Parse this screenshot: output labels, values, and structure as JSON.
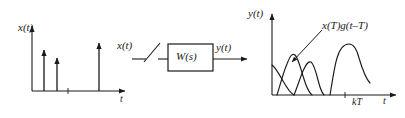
{
  "figure": {
    "background_color": "#ffffff",
    "line_color": "#1a1a1a"
  },
  "left_plot": {
    "y_axis_label": "x(t)",
    "x_axis_label": "t",
    "origin_tick_label": "0",
    "impulses": [
      {
        "position_label": "1",
        "height_fraction": 0.62
      },
      {
        "position_label": "2",
        "height_fraction": 0.48
      },
      {
        "position_label": "3",
        "height_fraction": 0.75
      }
    ]
  },
  "block_diagram": {
    "input_label": "x(t)",
    "sampler_name": "sampler-switch",
    "block_label": "W(s)",
    "output_label": "y(t)"
  },
  "right_plot": {
    "y_axis_label": "y(t)",
    "x_axis_label": "t",
    "x_axis_sample_label": "kT",
    "origin_tick_label": "0",
    "annotation": "x(T)g(t–T)",
    "curve_count": 3,
    "curve_names": [
      "response-curve-1",
      "response-curve-2",
      "response-curve-3"
    ]
  }
}
